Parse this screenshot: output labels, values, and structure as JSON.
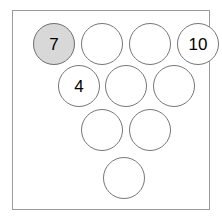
{
  "diagram": {
    "title": "",
    "frame": {
      "border_color": "#9a9a9a",
      "background": "#ffffff"
    },
    "type": "bowling-pin-triangle",
    "rows": [
      4,
      3,
      2,
      1
    ],
    "pin_colors": {
      "default_fill": "#ffffff",
      "default_stroke": "#777777",
      "highlight_fill": "#d8d8d8",
      "highlight_stroke": "#6e6e6e",
      "label_color": "#000000"
    },
    "pins": [
      {
        "id": "pin-7",
        "label": "7",
        "row": 1,
        "col": 1,
        "x": 20,
        "y": 12,
        "filled": true
      },
      {
        "id": "pin-r1c2",
        "label": "",
        "row": 1,
        "col": 2,
        "x": 68,
        "y": 12,
        "filled": false
      },
      {
        "id": "pin-r1c3",
        "label": "",
        "row": 1,
        "col": 3,
        "x": 116,
        "y": 12,
        "filled": false
      },
      {
        "id": "pin-10",
        "label": "10",
        "row": 1,
        "col": 4,
        "x": 164,
        "y": 12,
        "filled": false
      },
      {
        "id": "pin-4",
        "label": "4",
        "row": 2,
        "col": 1,
        "x": 45,
        "y": 54,
        "filled": false
      },
      {
        "id": "pin-r2c2",
        "label": "",
        "row": 2,
        "col": 2,
        "x": 92,
        "y": 54,
        "filled": false
      },
      {
        "id": "pin-r2c3",
        "label": "",
        "row": 2,
        "col": 3,
        "x": 140,
        "y": 54,
        "filled": false
      },
      {
        "id": "pin-r3c1",
        "label": "",
        "row": 3,
        "col": 1,
        "x": 68,
        "y": 98,
        "filled": false
      },
      {
        "id": "pin-r3c2",
        "label": "",
        "row": 3,
        "col": 2,
        "x": 116,
        "y": 98,
        "filled": false
      },
      {
        "id": "pin-r4c1",
        "label": "",
        "row": 4,
        "col": 1,
        "x": 90,
        "y": 146,
        "filled": false
      }
    ]
  }
}
